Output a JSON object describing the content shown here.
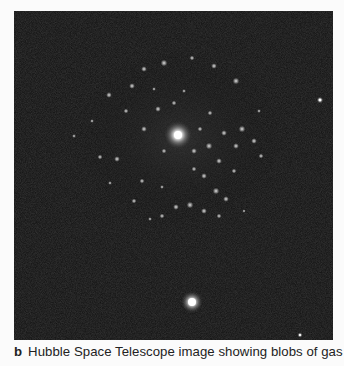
{
  "figure": {
    "panel_label": "b",
    "caption": "Hubble Space Telescope image showing blobs of gas",
    "image": {
      "description": "Dark night-sky astronomical photograph of a galaxy with bright central core surrounded by a ring of glowing gas blobs, plus two foreground stars",
      "background_color": "#0d0d0d",
      "features": [
        {
          "name": "galaxy-core",
          "x": 164,
          "y": 124,
          "r": 7
        },
        {
          "name": "foreground-star-lower",
          "x": 178,
          "y": 291,
          "r": 6
        },
        {
          "name": "foreground-star-right",
          "x": 306,
          "y": 89,
          "r": 2
        },
        {
          "name": "foreground-star-bottom-right",
          "x": 286,
          "y": 324,
          "r": 1.5
        }
      ]
    }
  }
}
